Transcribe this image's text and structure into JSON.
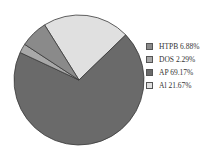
{
  "chart_data": {
    "type": "pie",
    "title": "",
    "slices": [
      {
        "label": "HTPB",
        "value": 6.88,
        "display": "HTPB 6.88%",
        "color": "#8a8a8a"
      },
      {
        "label": "DOS",
        "value": 2.29,
        "display": "DOS 2.29%",
        "color": "#a8a8a8"
      },
      {
        "label": "AP",
        "value": 69.17,
        "display": "AP 69.17%",
        "color": "#6a6a6a"
      },
      {
        "label": "Al",
        "value": 21.67,
        "display": "Al 21.67%",
        "color": "#e0e0e0"
      }
    ],
    "legend_position": "right"
  },
  "legend": {
    "items": [
      {
        "text": "HTPB 6.88%",
        "color": "#8a8a8a"
      },
      {
        "text": "DOS 2.29%",
        "color": "#a8a8a8"
      },
      {
        "text": "AP 69.17%",
        "color": "#6a6a6a"
      },
      {
        "text": "Al 21.67%",
        "color": "#e0e0e0"
      }
    ]
  }
}
